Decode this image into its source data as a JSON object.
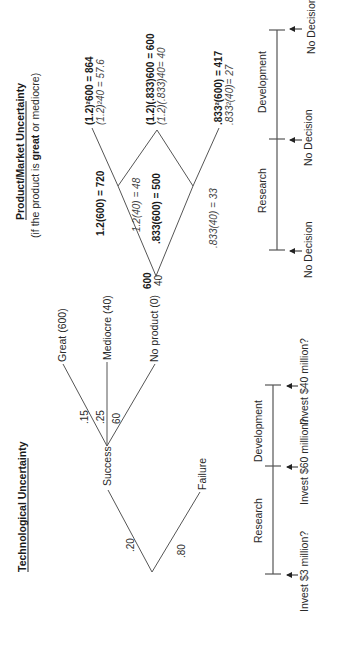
{
  "tech": {
    "title": "Technological Uncertainty",
    "prob_success": ".20",
    "prob_failure": ".80",
    "success_label": "Success",
    "failure_label": "Failure",
    "prob_great": ".15",
    "prob_mediocre": ".25",
    "prob_none": "60",
    "great_label": "Great (600)",
    "mediocre_label": "Mediocre (40)",
    "none_label": "No product (0)"
  },
  "market": {
    "title": "Product/Market Uncertainty",
    "subtitle_pre": "(if the product is ",
    "subtitle_bold": "great",
    "subtitle_post": " or mediocre)",
    "root_great": "600",
    "root_mediocre": "40",
    "up_great": "1.2(600) = 720",
    "up_mediocre": "1.2(40) = 48",
    "down_great": ".833(600) = 500",
    "down_mediocre": ".833(40) = 33",
    "uu_great": "(1.2)²600 = 864",
    "uu_mediocre": "(1.2)²40 = 57.6",
    "ud_great": "(1.2)(.833)600 = 600",
    "ud_mediocre": "(1.2)(.833)40= 40",
    "dd_great": ".833²(600) = 417",
    "dd_mediocre": ".833²(40)= 27"
  },
  "timeline_left": {
    "phase1": "Research",
    "phase2": "Development",
    "decisions": [
      "Invest $3 million?",
      "Invest $60 million?",
      "Invest $40 million?"
    ]
  },
  "timeline_right": {
    "phase1": "Research",
    "phase2": "Development",
    "decisions": [
      "No Decision",
      "No Decision",
      "No Decision"
    ]
  },
  "colors": {
    "line": "#555555",
    "text": "#2a2a2a"
  }
}
